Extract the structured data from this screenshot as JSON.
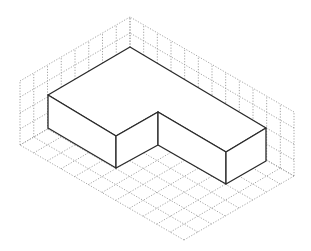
{
  "diagram": {
    "type": "isometric-drawing",
    "colors": {
      "grid": "#9a9a9a",
      "solid_stroke": "#2a2a2a",
      "background": "#ffffff"
    },
    "grid": {
      "floor_cells_left": 12,
      "floor_cells_right": 8,
      "wall_rows": 4
    },
    "solid": {
      "shape": "L-shaped prism",
      "height_units": 2
    }
  }
}
